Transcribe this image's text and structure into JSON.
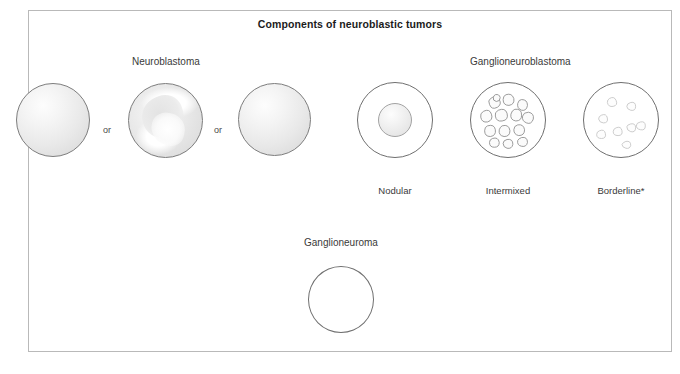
{
  "figure": {
    "title": "Components of neuroblastic tumors",
    "border_color": "#b9b9b9",
    "stroke_color": "#6f6f6f",
    "sphere_fill": "#ededed",
    "text_color": "#3a3a3a"
  },
  "groups": [
    {
      "id": "neuroblastoma",
      "header": "Neuroblastoma",
      "connector_label_1": "or",
      "connector_label_2": "or",
      "variants": [
        {
          "id": "neuroblastoma-solid-1",
          "label": "",
          "style": "solid-sphere"
        },
        {
          "id": "neuroblastoma-swirl",
          "label": "",
          "style": "swirled-sphere"
        },
        {
          "id": "neuroblastoma-solid-2",
          "label": "",
          "style": "solid-sphere"
        }
      ]
    },
    {
      "id": "ganglioneuroblastoma",
      "header": "Ganglioneuroblastoma",
      "variants": [
        {
          "id": "gnb-nodular",
          "label": "Nodular",
          "style": "outline-with-central-nodule"
        },
        {
          "id": "gnb-intermixed",
          "label": "Intermixed",
          "style": "outline-with-many-blobs"
        },
        {
          "id": "gnb-borderline",
          "label": "Borderline*",
          "style": "outline-with-sparse-faint-blobs"
        }
      ]
    },
    {
      "id": "ganglioneuroma",
      "header": "Ganglioneuroma",
      "variants": [
        {
          "id": "gn-plain",
          "label": "",
          "style": "empty-outline"
        }
      ]
    }
  ]
}
